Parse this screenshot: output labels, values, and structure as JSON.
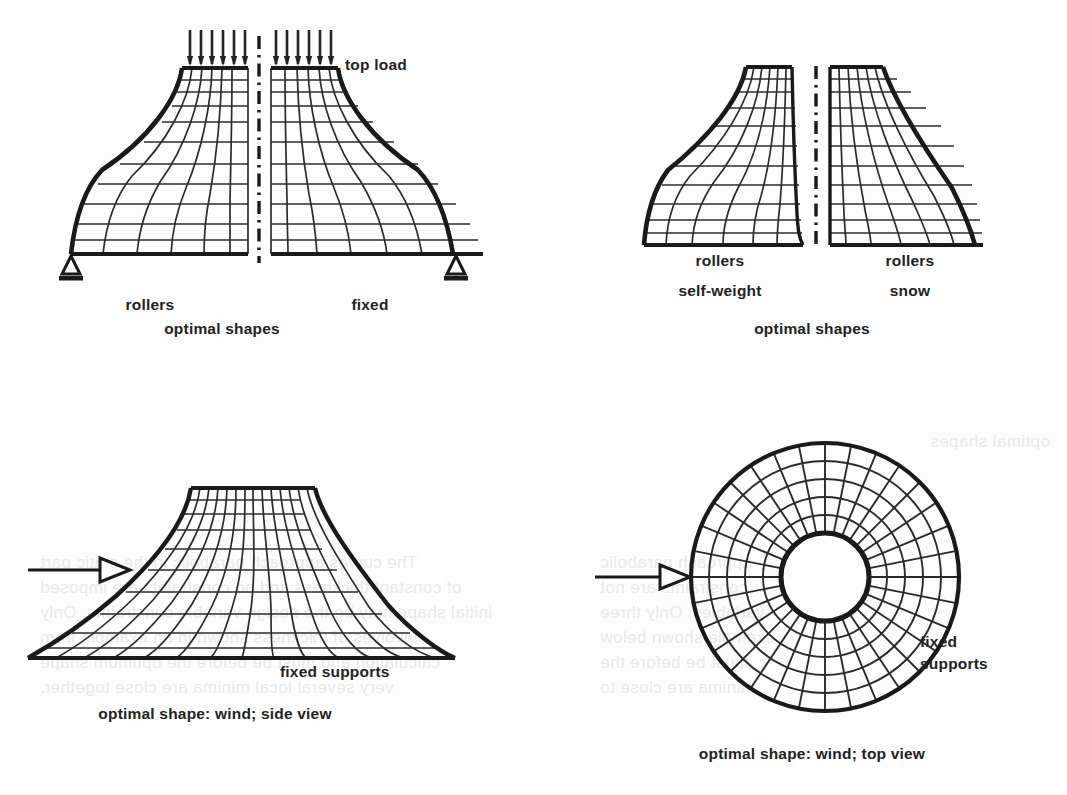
{
  "page": {
    "background_color": "#fdfdfd",
    "ink_color": "#232323"
  },
  "figures": [
    {
      "id": "top-left",
      "name": "optimal-shapes-top-load",
      "caption": "optimal shapes",
      "load_label": "top load",
      "centerline": "dash-dot vertical axis of symmetry",
      "halves": [
        {
          "side": "left",
          "support_label": "rollers",
          "support_symbol": "triangle-roller"
        },
        {
          "side": "right",
          "support_label": "fixed",
          "support_symbol": "triangle-fixed"
        }
      ]
    },
    {
      "id": "top-right",
      "name": "optimal-shapes-self-weight-snow",
      "caption": "optimal shapes",
      "centerline": "dash-dot vertical axis of symmetry",
      "halves": [
        {
          "side": "left",
          "support_label": "rollers",
          "load_label": "self-weight"
        },
        {
          "side": "right",
          "support_label": "rollers",
          "load_label": "snow"
        }
      ]
    },
    {
      "id": "bottom-left",
      "name": "optimal-shape-wind-side-view",
      "caption": "optimal shape: wind; side view",
      "support_label": "fixed supports",
      "wind_arrow": "wind-direction-arrow"
    },
    {
      "id": "bottom-right",
      "name": "optimal-shape-wind-top-view",
      "caption": "optimal shape: wind; top view",
      "support_label_line1": "fixed",
      "support_label_line2": "supports",
      "wind_arrow": "wind-direction-arrow"
    }
  ],
  "bleed_through": [
    {
      "text": "optimal shapes",
      "x": 930,
      "y": 432
    },
    {
      "text": "The curves approach parabolic in the static part",
      "x": 40,
      "y": 553
    },
    {
      "text": "of constant thickness and no constraints are imposed",
      "x": 40,
      "y": 578
    },
    {
      "text": "initial shape may be the design variable constraints. Only",
      "x": 40,
      "y": 603
    },
    {
      "text": "involves of thickness shown in an example from",
      "x": 40,
      "y": 628
    },
    {
      "text": "calculation and must be before the optimum shape",
      "x": 40,
      "y": 653
    },
    {
      "text": "very several local minima are close together.",
      "x": 40,
      "y": 678
    },
    {
      "text": "approach parabolic",
      "x": 600,
      "y": 553
    },
    {
      "text": "constraints are not",
      "x": 600,
      "y": 578
    },
    {
      "text": "variables. Only three",
      "x": 600,
      "y": 603
    },
    {
      "text": "example shown below",
      "x": 600,
      "y": 628
    },
    {
      "text": "must be before the",
      "x": 600,
      "y": 653
    },
    {
      "text": "minima are close to",
      "x": 600,
      "y": 678
    }
  ]
}
